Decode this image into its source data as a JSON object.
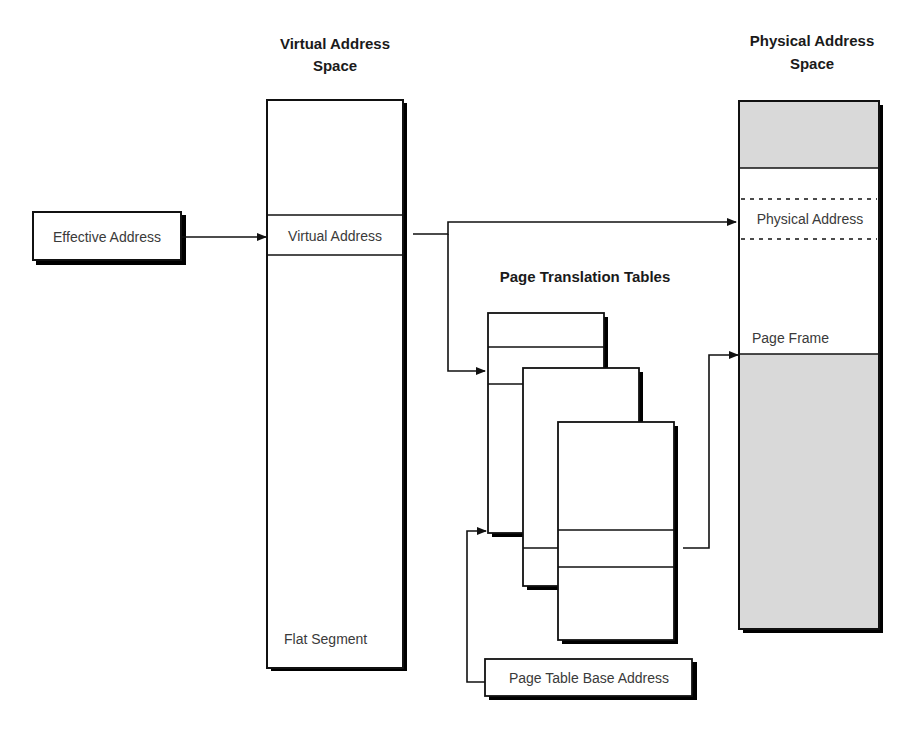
{
  "diagram": {
    "headers": {
      "virtual_space_line1": "Virtual Address",
      "virtual_space_line2": "Space",
      "physical_space_line1": "Physical Address",
      "physical_space_line2": "Space",
      "page_tables": "Page Translation Tables"
    },
    "labels": {
      "effective_address": "Effective Address",
      "virtual_address": "Virtual Address",
      "flat_segment": "Flat Segment",
      "physical_address": "Physical Address",
      "page_frame": "Page Frame",
      "page_table_base": "Page Table Base Address"
    },
    "colors": {
      "line": "#111111",
      "shaded_region": "#d9d9d9",
      "text": "#3a3a3a"
    }
  }
}
